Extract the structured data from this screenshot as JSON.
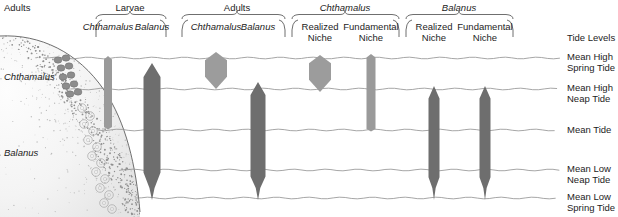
{
  "figure": {
    "left_axis": {
      "adults_label": "Adults",
      "species_upper": "Chthamalus",
      "species_lower": "Balanus"
    },
    "groups": [
      {
        "name": "Larvae",
        "center": 130,
        "left": 96,
        "right": 166,
        "columns": [
          {
            "label": "Chthamalus",
            "x": 108
          },
          {
            "label": "Balanus",
            "x": 152
          }
        ]
      },
      {
        "name": "Adults",
        "center": 237,
        "left": 182,
        "right": 285,
        "columns": [
          {
            "label": "Chthamalus",
            "x": 216
          },
          {
            "label": "Balanus",
            "x": 258
          }
        ]
      },
      {
        "name": "Chthamalus",
        "center": 345,
        "left": 292,
        "right": 399,
        "italic": true,
        "columns": [
          {
            "label": "Realized\nNiche",
            "x": 320
          },
          {
            "label": "Fundamental\nNiche",
            "x": 371
          }
        ]
      },
      {
        "name": "Balanus",
        "center": 459,
        "left": 406,
        "right": 513,
        "italic": true,
        "columns": [
          {
            "label": "Realized\nNiche",
            "x": 434
          },
          {
            "label": "Fundamental\nNiche",
            "x": 485
          }
        ]
      }
    ],
    "tide": {
      "header": "Tide Levels",
      "levels": [
        {
          "label": "Mean High\nSpring Tide",
          "y": 58
        },
        {
          "label": "Mean High\nNeap Tide",
          "y": 89
        },
        {
          "label": "Mean Tide",
          "y": 130
        },
        {
          "label": "Mean Low\nNeap Tide",
          "y": 170
        },
        {
          "label": "Mean Low\nSpring Tide",
          "y": 198
        }
      ]
    },
    "bars": [
      {
        "name": "larvae-chthamalus",
        "x": 108,
        "top": 57,
        "bottom": 128,
        "half_width": 4.0,
        "shape": "bar",
        "color": "#9a9a9a"
      },
      {
        "name": "larvae-balanus",
        "x": 152,
        "top": 63,
        "bottom": 200,
        "half_width": 8.5,
        "shape": "spindle",
        "color": "#6e6e6e"
      },
      {
        "name": "adults-chthamalus",
        "x": 216,
        "top": 52,
        "bottom": 89,
        "half_width": 11.0,
        "shape": "lens",
        "color": "#9c9c9c"
      },
      {
        "name": "adults-balanus",
        "x": 258,
        "top": 82,
        "bottom": 200,
        "half_width": 7.5,
        "shape": "spindle",
        "color": "#6e6e6e"
      },
      {
        "name": "chthamalus-realized-niche",
        "x": 320,
        "top": 55,
        "bottom": 92,
        "half_width": 11.0,
        "shape": "lens",
        "color": "#9c9c9c"
      },
      {
        "name": "chthamalus-fundamental-niche",
        "x": 371,
        "top": 55,
        "bottom": 130,
        "half_width": 4.5,
        "shape": "bar",
        "color": "#9a9a9a"
      },
      {
        "name": "balanus-realized-niche",
        "x": 434,
        "top": 86,
        "bottom": 200,
        "half_width": 5.5,
        "shape": "spindle",
        "color": "#6e6e6e"
      },
      {
        "name": "balanus-fundamental-niche",
        "x": 485,
        "top": 86,
        "bottom": 200,
        "half_width": 5.5,
        "shape": "spindle",
        "color": "#6e6e6e"
      }
    ],
    "colors": {
      "light_gray": "#9c9c9c",
      "dark_gray": "#6e6e6e",
      "tide_line": "#8f8f8f",
      "rock_stipple": "#b9b9b9",
      "text": "#1d1d1d"
    }
  }
}
